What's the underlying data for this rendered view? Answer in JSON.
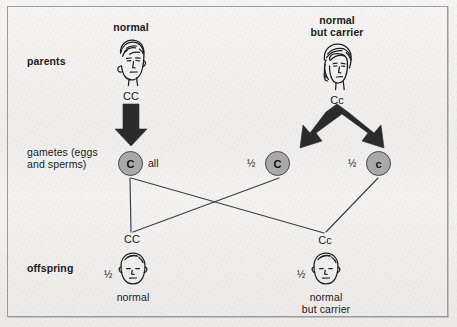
{
  "diagram": {
    "title_alt": "Inheritance of a recessive allele: normal x normal-but-carrier cross",
    "row_labels": {
      "parents": "parents",
      "gametes": "gametes (eggs\nand sperms)",
      "offspring": "offspring"
    },
    "parents": [
      {
        "id": "parent-left",
        "caption": "normal",
        "genotype": "CC",
        "sex_icon": "male-head-icon"
      },
      {
        "id": "parent-right",
        "caption": "normal\nbut carrier",
        "genotype": "Cc",
        "sex_icon": "female-head-icon"
      }
    ],
    "gametes": [
      {
        "id": "gamete-left",
        "allele": "C",
        "proportion": "all",
        "proportion_side": "right"
      },
      {
        "id": "gamete-mid",
        "allele": "C",
        "proportion": "½",
        "proportion_side": "left"
      },
      {
        "id": "gamete-right",
        "allele": "c",
        "proportion": "½",
        "proportion_side": "left"
      }
    ],
    "offspring": [
      {
        "id": "offspring-left",
        "genotype": "CC",
        "proportion": "½",
        "caption": "normal",
        "icon": "baby-head-icon"
      },
      {
        "id": "offspring-right",
        "genotype": "Cc",
        "proportion": "½",
        "caption": "normal\nbut carrier",
        "icon": "baby-head-icon"
      }
    ],
    "arrows": [
      {
        "id": "arrow-parent-left-to-gamete",
        "type": "thick-straight-down-arrow"
      },
      {
        "id": "arrow-parent-right-split",
        "type": "thick-v-split-arrow"
      }
    ],
    "cross_lines": [
      {
        "id": "line-gamete-left-to-offspring-left",
        "from": "gamete-left",
        "to": "offspring-left"
      },
      {
        "id": "line-gamete-left-to-offspring-right",
        "from": "gamete-left",
        "to": "offspring-right"
      },
      {
        "id": "line-gamete-mid-to-offspring-left",
        "from": "gamete-mid",
        "to": "offspring-left"
      },
      {
        "id": "line-gamete-right-to-offspring-right",
        "from": "gamete-right",
        "to": "offspring-right"
      }
    ],
    "colors": {
      "gamete_fill": "#a9a9a9",
      "gamete_stroke": "#4a4a4a",
      "arrow_fill": "#2b2b2b",
      "line_stroke": "#3d3d3d",
      "frame_stroke": "#9b9b9b",
      "background": "#f2f1ef",
      "text": "#1a1a1a"
    }
  }
}
